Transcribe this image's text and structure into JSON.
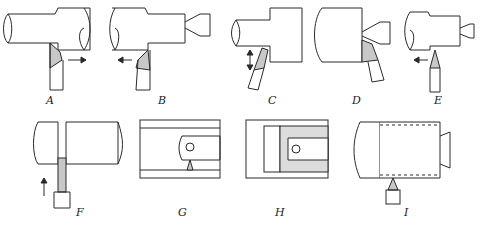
{
  "figure": {
    "panels": [
      {
        "id": "A",
        "label": "A",
        "operation": "turning (feed right)"
      },
      {
        "id": "B",
        "label": "B",
        "operation": "turning (feed left)"
      },
      {
        "id": "C",
        "label": "C",
        "operation": "facing"
      },
      {
        "id": "D",
        "label": "D",
        "operation": "facing with center"
      },
      {
        "id": "E",
        "label": "E",
        "operation": "chamfer / form turning"
      },
      {
        "id": "F",
        "label": "F",
        "operation": "parting / grooving"
      },
      {
        "id": "G",
        "label": "G",
        "operation": "boring"
      },
      {
        "id": "H",
        "label": "H",
        "operation": "internal threading"
      },
      {
        "id": "I",
        "label": "I",
        "operation": "external threading"
      }
    ]
  },
  "colors": {
    "stroke": "#2a2a2a",
    "tool_tip": "#c8c8c8",
    "background": "#ffffff"
  }
}
